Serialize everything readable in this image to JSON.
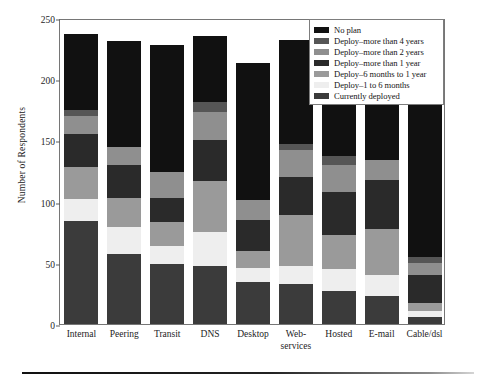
{
  "chart_data": {
    "type": "bar",
    "subtype": "stacked-bar",
    "title": "",
    "xlabel": "",
    "ylabel": "Number of Respondents",
    "ylim": [
      0,
      250
    ],
    "yticks": [
      0,
      50,
      100,
      150,
      200,
      250
    ],
    "grid": false,
    "legend_position": "top-right",
    "categories": [
      "Internal",
      "Peering",
      "Transit",
      "DNS",
      "Desktop",
      "Web-\nservices",
      "Hosted",
      "E-mail",
      "Cable/dsl"
    ],
    "series": [
      {
        "name": "Currently deployed",
        "color": "#3b3b3b",
        "values": [
          84,
          57,
          49,
          47,
          34,
          33,
          27,
          23,
          6
        ]
      },
      {
        "name": "Deploy–1 to 6 months",
        "color": "#eeeeee",
        "values": [
          18,
          22,
          15,
          28,
          12,
          14,
          18,
          17,
          5
        ]
      },
      {
        "name": "Deploy–6 months to 1 year",
        "color": "#9a9a9a",
        "values": [
          26,
          24,
          19,
          42,
          14,
          42,
          28,
          38,
          6
        ]
      },
      {
        "name": "Deploy–more than 1 year",
        "color": "#2a2a2a",
        "values": [
          27,
          27,
          20,
          33,
          25,
          31,
          35,
          40,
          23
        ]
      },
      {
        "name": "Deploy–more than 2 years",
        "color": "#8f8f8f",
        "values": [
          15,
          15,
          21,
          23,
          16,
          22,
          22,
          16,
          10
        ]
      },
      {
        "name": "Deploy–more than 4 years",
        "color": "#565656",
        "values": [
          5,
          0,
          0,
          8,
          0,
          5,
          7,
          0,
          5
        ]
      },
      {
        "name": "No plan",
        "color": "#111111",
        "values": [
          62,
          86,
          104,
          54,
          112,
          85,
          86,
          89,
          168
        ]
      }
    ],
    "totals": [
      237,
      231,
      228,
      235,
      213,
      232,
      223,
      223,
      223
    ],
    "legend_order_top_to_bottom": [
      "No plan",
      "Deploy–more than 4 years",
      "Deploy–more than 2 years",
      "Deploy–more than 1 year",
      "Deploy–6 months to 1 year",
      "Deploy–1 to 6 months",
      "Currently deployed"
    ]
  }
}
